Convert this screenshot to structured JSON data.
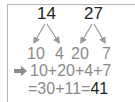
{
  "tree": {
    "left_number": "14",
    "right_number": "27",
    "left_parts": [
      "10",
      "4"
    ],
    "right_parts": [
      "20",
      "7"
    ]
  },
  "steps": {
    "arrow_icon": "right-arrow",
    "step1": "10+20+4+7",
    "step2_prefix": "=30+11=",
    "answer": "41"
  },
  "colors": {
    "text_dark": "#222222",
    "text_gray": "#8a8a8a",
    "arrow_gray": "#9a9a9a",
    "border": "#b5b5b5"
  }
}
